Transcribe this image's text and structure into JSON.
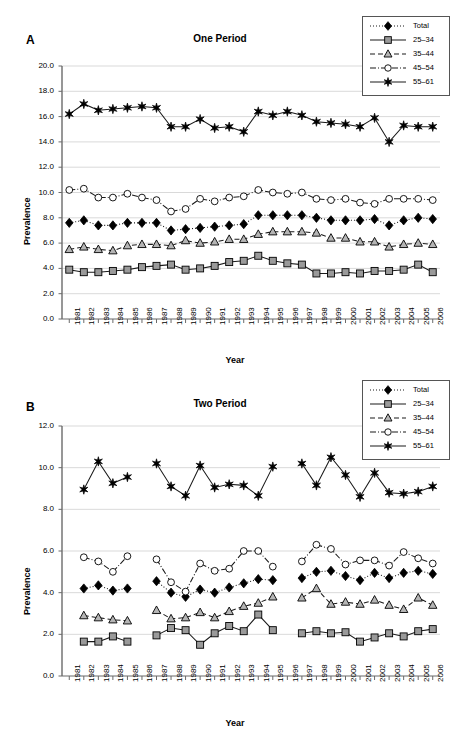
{
  "figure": {
    "width": 453,
    "height": 734,
    "background": "#ffffff"
  },
  "legend": {
    "entries": [
      {
        "label": "Total",
        "marker": "diamond",
        "fill": "#000000",
        "stroke": "#000000",
        "dash": "dotted"
      },
      {
        "label": "25–34",
        "marker": "square",
        "fill": "#9a9a9a",
        "stroke": "#000000",
        "dash": "solid"
      },
      {
        "label": "35–44",
        "marker": "triangle",
        "fill": "#b5b5b5",
        "stroke": "#000000",
        "dash": "dashed"
      },
      {
        "label": "45–54",
        "marker": "circle",
        "fill": "#ffffff",
        "stroke": "#000000",
        "dash": "dashdot"
      },
      {
        "label": "55–61",
        "marker": "star",
        "fill": "#000000",
        "stroke": "#000000",
        "dash": "solid"
      }
    ],
    "position": "top-right"
  },
  "panels": [
    {
      "letter": "A",
      "title": "One Period",
      "xlabel": "Year",
      "ylabel": "Prevalence"
    },
    {
      "letter": "B",
      "title": "Two Period",
      "xlabel": "Year",
      "ylabel": "Prevalence"
    }
  ],
  "chart_data": [
    {
      "type": "line",
      "panel": "A",
      "title": "One Period",
      "xlabel": "Year",
      "ylabel": "Prevalence",
      "grid": true,
      "legend_position": "top-right",
      "xlim": [
        1981,
        2006
      ],
      "ylim": [
        0.0,
        20.0
      ],
      "yticks": [
        0.0,
        2.0,
        4.0,
        6.0,
        8.0,
        10.0,
        12.0,
        14.0,
        16.0,
        18.0,
        20.0
      ],
      "ytick_labels": [
        "0.0",
        "2.0",
        "4.0",
        "6.0",
        "8.0",
        "10.0",
        "12.0",
        "14.0",
        "16.0",
        "18.0",
        "20.0"
      ],
      "x": [
        1981,
        1982,
        1983,
        1984,
        1985,
        1986,
        1987,
        1988,
        1989,
        1990,
        1991,
        1992,
        1993,
        1994,
        1995,
        1996,
        1997,
        1998,
        1999,
        2000,
        2001,
        2002,
        2003,
        2004,
        2005,
        2006
      ],
      "xtick_labels": [
        "1981",
        "1982",
        "1983",
        "1984",
        "1985",
        "1986",
        "1987",
        "1988",
        "1989",
        "1990",
        "1991",
        "1992",
        "1993",
        "1994",
        "1995",
        "1996",
        "1997",
        "1998",
        "1999",
        "2000",
        "2001",
        "2002",
        "2003",
        "2004",
        "2005",
        "2006"
      ],
      "series": [
        {
          "name": "Total",
          "marker": "diamond",
          "values": [
            7.6,
            7.8,
            7.4,
            7.4,
            7.6,
            7.6,
            7.6,
            7.0,
            7.1,
            7.2,
            7.3,
            7.4,
            7.5,
            8.2,
            8.2,
            8.2,
            8.2,
            8.0,
            7.8,
            7.8,
            7.8,
            7.9,
            7.4,
            7.8,
            8.0,
            7.9
          ]
        },
        {
          "name": "25–34",
          "marker": "square",
          "values": [
            3.9,
            3.7,
            3.7,
            3.8,
            3.9,
            4.1,
            4.2,
            4.3,
            3.9,
            4.0,
            4.2,
            4.5,
            4.6,
            5.0,
            4.6,
            4.4,
            4.3,
            3.6,
            3.6,
            3.7,
            3.6,
            3.8,
            3.8,
            3.9,
            4.3,
            3.7
          ]
        },
        {
          "name": "35–44",
          "marker": "triangle",
          "values": [
            5.5,
            5.7,
            5.5,
            5.4,
            5.8,
            5.9,
            5.9,
            5.8,
            6.2,
            6.0,
            6.1,
            6.3,
            6.3,
            6.7,
            6.9,
            6.9,
            6.9,
            6.8,
            6.4,
            6.4,
            6.1,
            6.1,
            5.7,
            5.9,
            6.0,
            5.9
          ]
        },
        {
          "name": "45–54",
          "marker": "circle",
          "values": [
            10.2,
            10.3,
            9.6,
            9.6,
            9.9,
            9.6,
            9.4,
            8.5,
            8.7,
            9.5,
            9.3,
            9.6,
            9.7,
            10.2,
            10.0,
            9.9,
            10.0,
            9.5,
            9.4,
            9.5,
            9.2,
            9.1,
            9.5,
            9.5,
            9.5,
            9.4
          ]
        },
        {
          "name": "55–61",
          "marker": "star",
          "values": [
            16.2,
            17.0,
            16.5,
            16.6,
            16.7,
            16.8,
            16.7,
            15.2,
            15.2,
            15.8,
            15.1,
            15.2,
            14.8,
            16.4,
            16.1,
            16.4,
            16.1,
            15.6,
            15.5,
            15.4,
            15.2,
            15.9,
            14.0,
            15.3,
            15.2,
            15.2
          ]
        }
      ]
    },
    {
      "type": "line",
      "panel": "B",
      "title": "Two Period",
      "xlabel": "Year",
      "ylabel": "Prevalence",
      "grid": true,
      "legend_position": "top-right",
      "xlim": [
        1981,
        2006
      ],
      "ylim": [
        0.0,
        12.0
      ],
      "yticks": [
        0.0,
        2.0,
        4.0,
        6.0,
        8.0,
        10.0,
        12.0
      ],
      "ytick_labels": [
        "0.0",
        "2.0",
        "4.0",
        "6.0",
        "8.0",
        "10.0",
        "12.0"
      ],
      "x": [
        1981,
        1982,
        1983,
        1984,
        1985,
        1986,
        1987,
        1988,
        1989,
        1990,
        1991,
        1992,
        1993,
        1994,
        1995,
        1996,
        1997,
        1998,
        1999,
        2000,
        2001,
        2002,
        2003,
        2004,
        2005,
        2006
      ],
      "xtick_labels": [
        "1981",
        "1982",
        "1983",
        "1984",
        "1985",
        "1986",
        "1987",
        "1988",
        "1989",
        "1990",
        "1991",
        "1992",
        "1993",
        "1994",
        "1995",
        "1996",
        "1997",
        "1998",
        "1999",
        "2000",
        "2001",
        "2002",
        "2003",
        "2004",
        "2005",
        "2006"
      ],
      "missing_years": [
        1981,
        1986,
        1996
      ],
      "series": [
        {
          "name": "Total",
          "marker": "diamond",
          "values": [
            null,
            4.2,
            4.35,
            4.1,
            4.2,
            null,
            4.55,
            4.0,
            3.8,
            4.15,
            4.0,
            4.25,
            4.45,
            4.65,
            4.6,
            null,
            4.7,
            5.0,
            5.05,
            4.8,
            4.6,
            4.95,
            4.7,
            4.95,
            5.05,
            4.9
          ]
        },
        {
          "name": "25–34",
          "marker": "square",
          "values": [
            null,
            1.65,
            1.65,
            1.9,
            1.65,
            null,
            1.95,
            2.3,
            2.2,
            1.5,
            2.05,
            2.4,
            2.15,
            2.95,
            2.2,
            null,
            2.05,
            2.15,
            2.05,
            2.1,
            1.65,
            1.85,
            2.05,
            1.9,
            2.15,
            2.25
          ]
        },
        {
          "name": "35–44",
          "marker": "triangle",
          "values": [
            null,
            2.9,
            2.8,
            2.7,
            2.65,
            null,
            3.15,
            2.75,
            2.8,
            3.05,
            2.8,
            3.1,
            3.35,
            3.5,
            3.8,
            null,
            3.75,
            4.2,
            3.45,
            3.55,
            3.45,
            3.65,
            3.4,
            3.2,
            3.75,
            3.4
          ]
        },
        {
          "name": "45–54",
          "marker": "circle",
          "values": [
            null,
            5.7,
            5.5,
            5.0,
            5.75,
            null,
            5.6,
            4.5,
            4.05,
            5.4,
            5.05,
            5.15,
            6.0,
            6.0,
            5.25,
            null,
            5.5,
            6.3,
            6.1,
            5.35,
            5.55,
            5.55,
            5.3,
            5.95,
            5.65,
            5.4
          ]
        },
        {
          "name": "55–61",
          "marker": "star",
          "values": [
            null,
            8.95,
            10.3,
            9.25,
            9.55,
            null,
            10.2,
            9.1,
            8.65,
            10.1,
            9.05,
            9.2,
            9.15,
            8.65,
            10.05,
            null,
            10.2,
            9.15,
            10.5,
            9.65,
            8.6,
            9.75,
            8.8,
            8.75,
            8.85,
            9.1
          ]
        }
      ]
    }
  ]
}
